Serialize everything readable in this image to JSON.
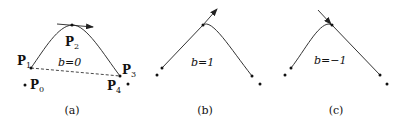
{
  "figure": {
    "panels": [
      {
        "id": "a",
        "caption": "(a)",
        "parameter_label": "b=0",
        "points": [
          {
            "name": "P0",
            "label": "P",
            "sub": "0"
          },
          {
            "name": "P1",
            "label": "P",
            "sub": "1"
          },
          {
            "name": "P2",
            "label": "P",
            "sub": "2"
          },
          {
            "name": "P3",
            "label": "P",
            "sub": "3"
          },
          {
            "name": "P4",
            "label": "P",
            "sub": "4"
          }
        ]
      },
      {
        "id": "b",
        "caption": "(b)",
        "parameter_label": "b=1"
      },
      {
        "id": "c",
        "caption": "(c)",
        "parameter_label": "b=−1"
      }
    ],
    "colors": {
      "curve": "#333333",
      "points": "#111111",
      "dashed": "#333333"
    }
  }
}
